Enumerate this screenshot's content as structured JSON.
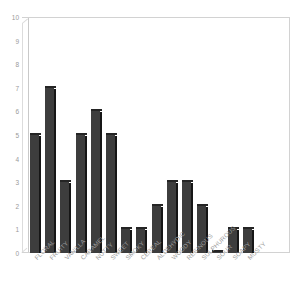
{
  "chart_data": {
    "type": "bar",
    "title": "",
    "xlabel": "",
    "ylabel": "",
    "ylim": [
      0,
      10
    ],
    "yticks": [
      "0",
      "1",
      "2",
      "3",
      "4",
      "5",
      "6",
      "7",
      "8",
      "9",
      "10"
    ],
    "grid": false,
    "legend": null,
    "categories": [
      "FLORAL",
      "FRUITY",
      "VANILLA",
      "CARAMEL",
      "NUTTY",
      "SWEET",
      "SMOKY",
      "CEREAL",
      "ALDEHYDIC",
      "WOODY",
      "RESINOUS",
      "SULPHUROUS",
      "SOUR",
      "SOAPY",
      "MUSTY"
    ],
    "values": [
      5,
      7,
      3,
      5,
      6,
      5,
      1,
      1,
      2,
      3,
      3,
      2,
      0,
      1,
      1
    ],
    "bar_color": "#3d3d3d",
    "bar_side_color": "#161616",
    "bar_top_color": "#242424",
    "axis_color": "#d2d2d2",
    "tick_label_color": "#9a9a9a"
  }
}
